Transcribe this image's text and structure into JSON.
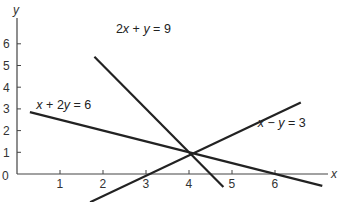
{
  "chart_data": {
    "type": "line",
    "title": "",
    "xlabel": "x",
    "ylabel": "y",
    "origin_label": "0",
    "x_ticks": [
      "1",
      "2",
      "3",
      "4",
      "5",
      "6"
    ],
    "y_ticks": [
      "1",
      "2",
      "3",
      "4",
      "5",
      "6"
    ],
    "xlim": [
      0,
      7.3
    ],
    "ylim": [
      -1.2,
      7.5
    ],
    "grid": false,
    "legend": "none",
    "series": [
      {
        "name": "2x+y=9",
        "label": "2x + y = 9",
        "points": [
          [
            1.8,
            5.4
          ],
          [
            4.8,
            -0.6
          ]
        ],
        "label_pos": [
          2.3,
          6.5
        ]
      },
      {
        "name": "x+2y=6",
        "label": "x + 2y = 6",
        "points": [
          [
            0.3,
            2.85
          ],
          [
            7.1,
            -0.55
          ]
        ],
        "label_pos": [
          0.45,
          3.0
        ]
      },
      {
        "name": "x-y=3",
        "label": "x − y = 3",
        "points": [
          [
            1.7,
            -1.3
          ],
          [
            6.6,
            3.3
          ]
        ],
        "label_pos": [
          5.6,
          2.15
        ]
      }
    ],
    "intersection": [
      4,
      1
    ]
  }
}
